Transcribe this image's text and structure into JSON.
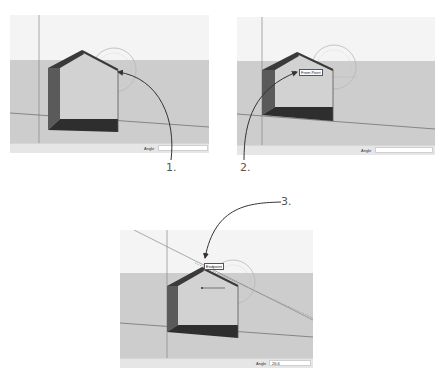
{
  "figure": {
    "colors": {
      "sky": "#f4f4f4",
      "ground": "#cdcdcd",
      "wall_dark": "#5a5a5a",
      "floor_dark": "#2e2e2e",
      "roof_edge": "#3a3a3a",
      "protractor": "#b9b9b9",
      "callout_arrow": "#333333"
    }
  },
  "panels": [
    {
      "step": "1.",
      "status": {
        "label": "Angle",
        "value": ""
      },
      "tooltip": ""
    },
    {
      "step": "2.",
      "status": {
        "label": "Angle",
        "value": ""
      },
      "tooltip": "From Point"
    },
    {
      "step": "3.",
      "status": {
        "label": "Angle",
        "value": "26.6"
      },
      "tooltip": "Endpoint"
    }
  ]
}
